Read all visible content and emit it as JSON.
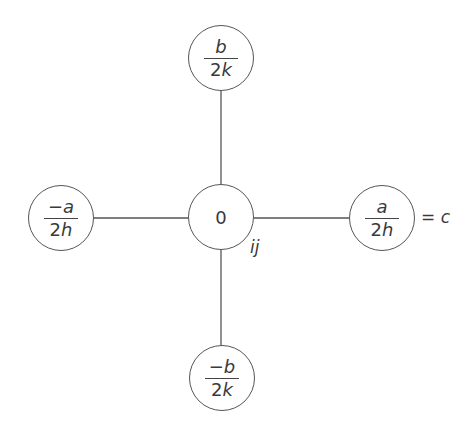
{
  "diagram": {
    "type": "five-point stencil",
    "center": {
      "value": "0",
      "index_label": "ij"
    },
    "top": {
      "sign": "",
      "numerator_var": "b",
      "denominator_coef": "2",
      "denominator_var": "k"
    },
    "bottom": {
      "sign": "−",
      "numerator_var": "b",
      "denominator_coef": "2",
      "denominator_var": "k"
    },
    "left": {
      "sign": "−",
      "numerator_var": "a",
      "denominator_coef": "2",
      "denominator_var": "h"
    },
    "right": {
      "sign": "",
      "numerator_var": "a",
      "denominator_coef": "2",
      "denominator_var": "h"
    },
    "right_annotation": {
      "eq": "= ",
      "var": "c"
    },
    "line_color": "#555555"
  }
}
